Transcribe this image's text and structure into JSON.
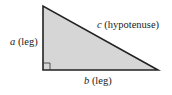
{
  "diagram": {
    "type": "right-triangle",
    "fill_color": "#d6d6d6",
    "stroke_color": "#222222",
    "labels": {
      "hypotenuse": {
        "var": "c",
        "text": "(hypotenuse)"
      },
      "vertical_leg": {
        "var": "a",
        "text": "(leg)"
      },
      "horizontal_leg": {
        "var": "b",
        "text": "(leg)"
      }
    },
    "right_angle_marker": true
  }
}
